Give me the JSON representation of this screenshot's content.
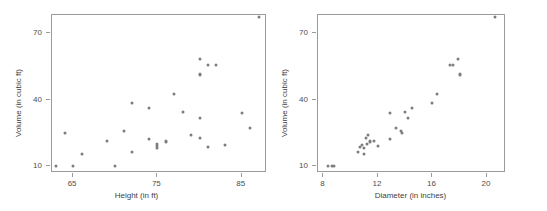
{
  "figure": {
    "background": "#ffffff",
    "point_color": "#7d7d7d",
    "frame_color": "#9a9a9a",
    "text_color": "#4d4d4d"
  },
  "chart_data": [
    {
      "type": "scatter",
      "title": "",
      "xlabel": "Height (in ft)",
      "ylabel": "Volume (in cubic ft)",
      "xlim": [
        62.5,
        88.0
      ],
      "ylim": [
        7.0,
        78.0
      ],
      "xticks": [
        65,
        75,
        85
      ],
      "xticklabels": [
        "65",
        "75",
        "85"
      ],
      "yticks": [
        10,
        40,
        70
      ],
      "yticklabels": [
        "10",
        "40",
        "70"
      ],
      "grid": false,
      "legend": null,
      "x": [
        70,
        65,
        63,
        72,
        81,
        83,
        66,
        75,
        80,
        75,
        79,
        76,
        76,
        69,
        75,
        74,
        85,
        86,
        71,
        64,
        78,
        80,
        74,
        72,
        77,
        81,
        82,
        80,
        80,
        80,
        87
      ],
      "y": [
        10.3,
        10.3,
        10.2,
        16.4,
        18.8,
        19.7,
        15.6,
        18.2,
        22.6,
        19.9,
        24.2,
        21.0,
        21.4,
        21.3,
        19.1,
        22.2,
        33.8,
        27.4,
        25.7,
        24.9,
        34.5,
        31.7,
        36.3,
        38.3,
        42.6,
        55.4,
        55.7,
        58.3,
        51.5,
        51.0,
        77.0
      ],
      "n": 31
    },
    {
      "type": "scatter",
      "title": "",
      "xlabel": "Diameter (in inches)",
      "ylabel": "Volume (in cubic ft)",
      "xlim": [
        7.6,
        21.4
      ],
      "ylim": [
        7.0,
        78.0
      ],
      "xticks": [
        8,
        12,
        16,
        20
      ],
      "xticklabels": [
        "8",
        "12",
        "16",
        "20"
      ],
      "yticks": [
        10,
        40,
        70
      ],
      "yticklabels": [
        "10",
        "40",
        "70"
      ],
      "grid": false,
      "legend": null,
      "x": [
        8.3,
        8.6,
        8.8,
        10.5,
        10.7,
        10.8,
        11.0,
        11.0,
        11.1,
        11.2,
        11.3,
        11.4,
        11.4,
        11.7,
        12.0,
        12.9,
        12.9,
        13.3,
        13.7,
        13.8,
        14.0,
        14.2,
        14.5,
        16.0,
        16.3,
        17.3,
        17.5,
        17.9,
        18.0,
        18.0,
        20.6
      ],
      "y": [
        10.3,
        10.3,
        10.2,
        16.4,
        18.8,
        19.7,
        15.6,
        18.2,
        22.6,
        19.9,
        24.2,
        21.0,
        21.4,
        21.3,
        19.1,
        22.2,
        33.8,
        27.4,
        25.7,
        24.9,
        34.5,
        31.7,
        36.3,
        38.3,
        42.6,
        55.4,
        55.7,
        58.3,
        51.5,
        51.0,
        77.0
      ],
      "n": 31
    }
  ]
}
